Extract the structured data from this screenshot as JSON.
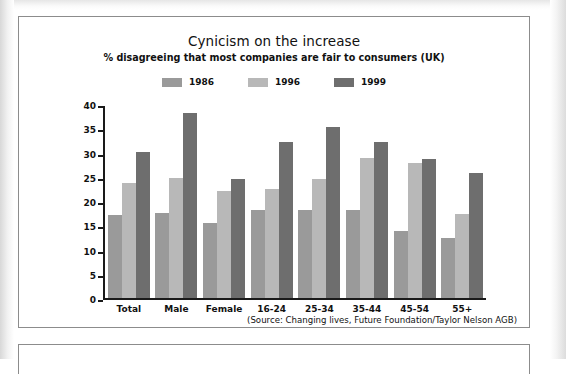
{
  "chart_data": {
    "type": "bar",
    "title": "Cynicism on the increase",
    "subtitle": "% disagreeing that most companies are fair to consumers (UK)",
    "source": "(Source: Changing lives, Future Foundation/Taylor Nelson AGB)",
    "xlabel": "",
    "ylabel": "",
    "ylim": [
      0,
      40
    ],
    "yticks": [
      "0",
      "5",
      "10",
      "15",
      "20",
      "25",
      "30",
      "35",
      "40"
    ],
    "grid": false,
    "legend_position": "top-center",
    "categories": [
      "Total",
      "Male",
      "Female",
      "16-24",
      "25-34",
      "35-44",
      "45-54",
      "55+"
    ],
    "series": [
      {
        "name": "1986",
        "color": "#9a9a9a",
        "values": [
          17.3,
          17.7,
          15.7,
          18.4,
          18.3,
          18.4,
          13.9,
          12.6
        ]
      },
      {
        "name": "1996",
        "color": "#b8b8b8",
        "values": [
          24.0,
          25.0,
          22.3,
          22.8,
          24.8,
          29.2,
          28.2,
          17.5
        ]
      },
      {
        "name": "1999",
        "color": "#6e6e6e",
        "values": [
          30.5,
          38.5,
          24.8,
          32.4,
          35.7,
          32.4,
          29.0,
          26.0
        ]
      }
    ]
  }
}
